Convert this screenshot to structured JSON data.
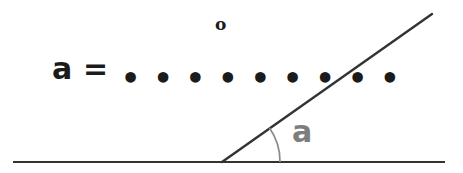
{
  "worksheet": {
    "background_color": "#ffffff",
    "width": 463,
    "height": 173
  },
  "answer_prompt": {
    "variable": "a",
    "equals": "=",
    "blank_dots": "• • • • • • • • •",
    "dot_count": 9,
    "degree_symbol": "o",
    "full_text": "a = ......... o",
    "text_color": "#1b1b1b"
  },
  "diagram": {
    "type": "angle-diagram",
    "angle_label": "a",
    "angle_label_color": "#7d7d7d",
    "line_color": "#333333",
    "arc_color": "#8a8a8a",
    "vertex": {
      "x": 222,
      "y": 162
    },
    "baseline": {
      "x1": 13,
      "y1": 162,
      "x2": 445,
      "y2": 162
    },
    "ray": {
      "x1": 222,
      "y1": 162,
      "x2": 432,
      "y2": 14
    },
    "arc_radius": 58,
    "angle_degrees": 35
  }
}
